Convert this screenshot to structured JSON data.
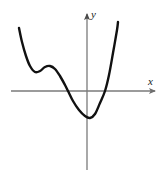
{
  "chart_data": {
    "type": "line",
    "title": "",
    "subtitle": "",
    "xlabel": "x",
    "ylabel": "y",
    "legend": [],
    "grid": false,
    "axes": {
      "style": "cartesian-arrows",
      "origin_px": [
        87,
        91
      ],
      "x_axis_px": {
        "x_start": 11,
        "x_end": 158,
        "y": 91
      },
      "y_axis_px": {
        "y_start": 11,
        "y_end": 170,
        "x": 87
      },
      "arrow_ends": [
        "x-positive",
        "y-positive"
      ],
      "tick_labels_x": [],
      "tick_labels_y": [],
      "color": "#6e6e6e"
    },
    "curve": {
      "name": "quartic-like polynomial",
      "color": "#111111",
      "line_width": 2.4,
      "shape_description": "Descends steeply from upper left, local minimum, rises to a local maximum, falls through the x-axis to a global minimum below the origin, then rises steeply through the x-axis to the upper right.",
      "points_px": [
        [
          19,
          28
        ],
        [
          22,
          42
        ],
        [
          26,
          56
        ],
        [
          30,
          66
        ],
        [
          35,
          72
        ],
        [
          40,
          71
        ],
        [
          45,
          67
        ],
        [
          50,
          66
        ],
        [
          55,
          69
        ],
        [
          60,
          76
        ],
        [
          65,
          85
        ],
        [
          68,
          91
        ],
        [
          73,
          101
        ],
        [
          79,
          110
        ],
        [
          85,
          116
        ],
        [
          90,
          118
        ],
        [
          95,
          114
        ],
        [
          100,
          103
        ],
        [
          105,
          91
        ],
        [
          109,
          75
        ],
        [
          113,
          53
        ],
        [
          117,
          30
        ],
        [
          118,
          22
        ]
      ],
      "features": {
        "left_endpoint_px": [
          19,
          28
        ],
        "local_minimum_px": [
          36,
          72
        ],
        "local_maximum_px": [
          49,
          66
        ],
        "global_minimum_px": [
          89,
          118
        ],
        "right_endpoint_px": [
          118,
          22
        ],
        "x_intercepts_px": [
          [
            68,
            91
          ],
          [
            105,
            91
          ]
        ],
        "y_intercept_px": [
          87,
          117
        ]
      }
    },
    "annotations": []
  },
  "labels": {
    "x": "x",
    "y": "y"
  }
}
